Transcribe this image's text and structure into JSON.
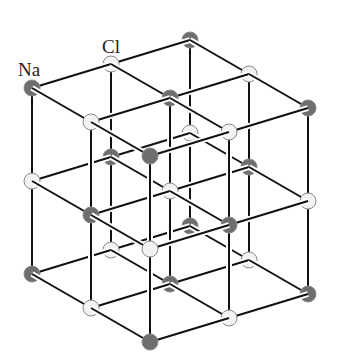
{
  "diagram": {
    "labels": [
      {
        "id": "na",
        "text": "Na",
        "x": 18,
        "y": 60
      },
      {
        "id": "cl",
        "text": "Cl",
        "x": 102,
        "y": 37
      }
    ],
    "lattice": {
      "size": 3,
      "origin": [
        32,
        88
      ],
      "a_step": [
        79,
        -24
      ],
      "b_step": [
        59,
        34
      ],
      "c_step": [
        0,
        93
      ],
      "node_radius": 8,
      "even_parity_species": "Na",
      "odd_parity_species": "Cl"
    },
    "colors": {
      "na": "#6e6e6e",
      "cl": "#f2f2f2",
      "edge": "#111111",
      "node_stroke": "#8a8a8a",
      "background": "#ffffff"
    }
  }
}
